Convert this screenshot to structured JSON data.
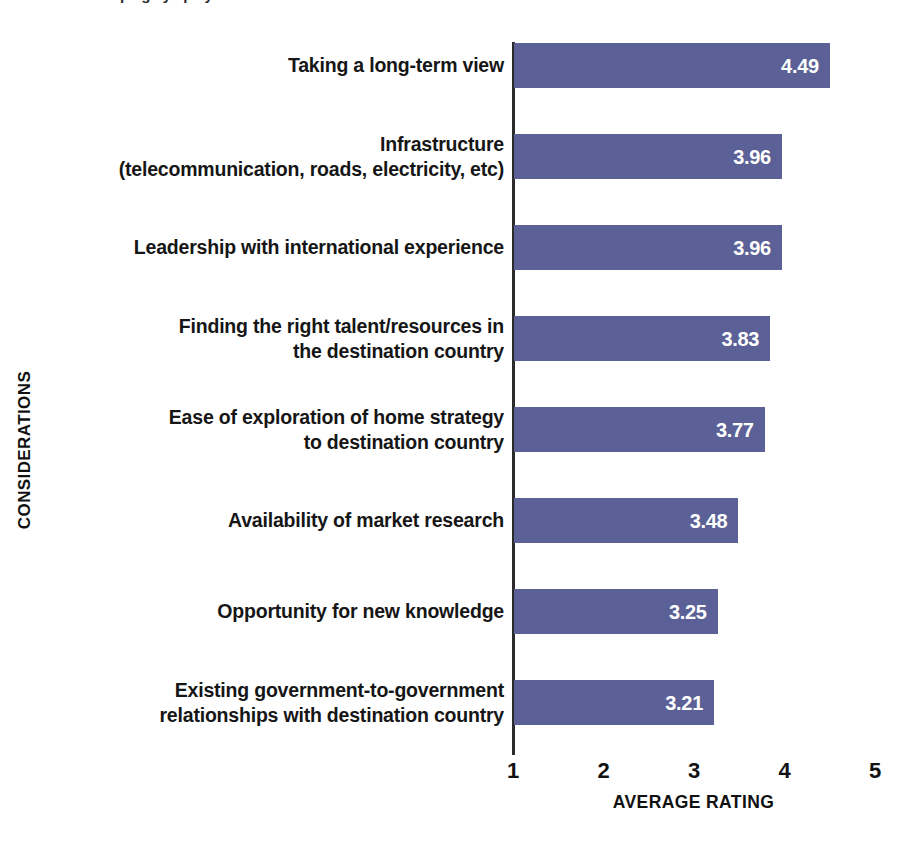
{
  "chart_data": {
    "type": "bar",
    "orientation": "horizontal",
    "title": "",
    "xlabel": "AVERAGE RATING",
    "ylabel": "CONSIDERATIONS",
    "xlim": [
      1,
      5
    ],
    "xticks": [
      "1",
      "2",
      "3",
      "4",
      "5"
    ],
    "grid": false,
    "legend": null,
    "bar_color": "#5b6196",
    "value_label_color": "#ffffff",
    "categories": [
      "Taking a long-term view",
      "Infrastructure (telecommunication, roads, electricity, etc)",
      "Leadership with international experience",
      "Finding the right talent/resources in the destination country",
      "Ease of exploration of home strategy to destination country",
      "Availability of market research",
      "Opportunity for new knowledge",
      "Existing government-to-government relationships with destination country"
    ],
    "values": [
      4.49,
      3.96,
      3.96,
      3.83,
      3.77,
      3.48,
      3.25,
      3.21
    ],
    "value_labels": [
      "4.49",
      "3.96",
      "3.96",
      "3.83",
      "3.77",
      "3.48",
      "3.25",
      "3.21"
    ]
  },
  "rows": [
    {
      "label_lines": [
        "Taking a long-term view"
      ],
      "value": 4.49,
      "value_label": "4.49"
    },
    {
      "label_lines": [
        "Infrastructure",
        "(telecommunication, roads, electricity, etc)"
      ],
      "value": 3.96,
      "value_label": "3.96"
    },
    {
      "label_lines": [
        "Leadership with international experience"
      ],
      "value": 3.96,
      "value_label": "3.96"
    },
    {
      "label_lines": [
        "Finding the right talent/resources in",
        "the destination country"
      ],
      "value": 3.83,
      "value_label": "3.83"
    },
    {
      "label_lines": [
        "Ease of exploration of home strategy",
        "to destination country"
      ],
      "value": 3.77,
      "value_label": "3.77"
    },
    {
      "label_lines": [
        "Availability of market research"
      ],
      "value": 3.48,
      "value_label": "3.48"
    },
    {
      "label_lines": [
        "Opportunity for new knowledge"
      ],
      "value": 3.25,
      "value_label": "3.25"
    },
    {
      "label_lines": [
        "Existing government-to-government",
        "relationships with destination country"
      ],
      "value": 3.21,
      "value_label": "3.21"
    }
  ],
  "axes": {
    "x_title": "AVERAGE RATING",
    "y_title": "CONSIDERATIONS",
    "x_ticks": [
      "1",
      "2",
      "3",
      "4",
      "5"
    ]
  }
}
